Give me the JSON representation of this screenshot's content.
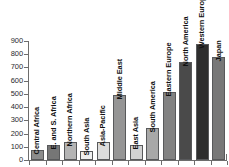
{
  "chart_data": {
    "type": "bar",
    "title": "",
    "subtitle": "",
    "xlabel": "",
    "ylabel": "",
    "ylim": [
      0,
      900
    ],
    "yticks": [
      0,
      100,
      200,
      300,
      400,
      500,
      600,
      700,
      800,
      900
    ],
    "ytick_labels": [
      "0",
      "100",
      "200",
      "300",
      "400",
      "500",
      "600",
      "700",
      "800",
      "900"
    ],
    "grid": false,
    "legend": null,
    "orientation": "vertical",
    "label_rotation": -90,
    "categories": [
      "Central Africa",
      "E. and S. Africa",
      "Northern Africa",
      "South Asia",
      "Asia-Pacific",
      "Middle East",
      "East Asia",
      "South America",
      "Eastern Europe",
      "North America",
      "Western Europe",
      "Japan"
    ],
    "values": [
      75,
      110,
      135,
      70,
      138,
      490,
      110,
      240,
      515,
      740,
      880,
      780
    ],
    "bar_colors": [
      "#8c8c8c",
      "#767676",
      "#b4b4b4",
      "#f0f0f0",
      "#dcdcdc",
      "#959595",
      "#d2d2d2",
      "#a8a8a8",
      "#828282",
      "#4a4a4a",
      "#2e2e2e",
      "#787878"
    ],
    "bar_edge_color": "#58595b",
    "axis_color": "#6d6d6d",
    "background_color": "#ffffff"
  }
}
